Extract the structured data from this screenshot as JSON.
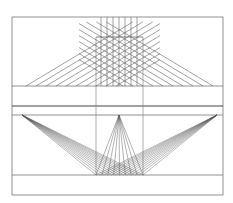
{
  "figure": {
    "title": "",
    "stroke_color": "#555555",
    "frame_color": "#777777",
    "background": "#ffffff"
  },
  "geometry": {
    "frame": {
      "x": 12,
      "y": 17,
      "w": 211,
      "h": 178
    },
    "upper": {
      "square": {
        "x0": 96,
        "x1": 143,
        "y0": 37,
        "y1": 86
      },
      "ground_y": 86,
      "verticals_x": [
        101,
        107,
        113,
        119,
        125,
        131,
        137
      ],
      "diag_slope": 0.6,
      "diag_left_starts": [
        26,
        36,
        46,
        56,
        66,
        76,
        86,
        96,
        106,
        116
      ],
      "diag_right_starts": [
        213,
        203,
        193,
        183,
        173,
        163,
        153,
        143,
        133,
        123
      ]
    },
    "band": {
      "y_top": 106,
      "y_horizon": 115
    },
    "lower": {
      "square": {
        "x0": 96,
        "x1": 143,
        "y_bottom": 175
      },
      "vp_left": [
        22,
        115
      ],
      "vp_center": [
        119,
        115
      ],
      "vp_right": [
        217,
        115
      ],
      "divisions": 8,
      "grid_top_y": 140
    },
    "bottom_line_y": 175
  }
}
